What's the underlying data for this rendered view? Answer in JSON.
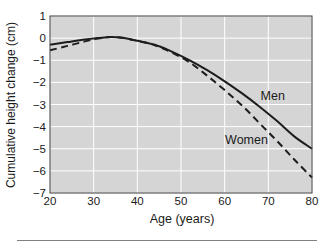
{
  "chart_data": {
    "type": "line",
    "title": "",
    "xlabel": "Age (years)",
    "ylabel": "Cumulative height change (cm)",
    "xlim": [
      20,
      80
    ],
    "ylim": [
      -7,
      1
    ],
    "xticks": [
      20,
      30,
      40,
      50,
      60,
      70,
      80
    ],
    "yticks": [
      1,
      0,
      -1,
      -2,
      -3,
      -4,
      -5,
      -6,
      -7
    ],
    "grid": true,
    "legend_position": "inline-annotations",
    "plot_bg": "#d5d5d5",
    "grid_color": "#ffffff",
    "frame_color": "#3c3c3c",
    "line_color": "#1c1c1c",
    "x": [
      20,
      24,
      28,
      31,
      34,
      37,
      40,
      44,
      48,
      52,
      56,
      60,
      64,
      68,
      72,
      76,
      80
    ],
    "series": [
      {
        "name": "Men",
        "style": "solid",
        "values": [
          -0.3,
          -0.18,
          -0.06,
          0.0,
          0.05,
          0.0,
          -0.12,
          -0.3,
          -0.62,
          -1.0,
          -1.45,
          -1.95,
          -2.5,
          -3.1,
          -3.75,
          -4.45,
          -5.0
        ],
        "label_at": [
          71,
          -2.6
        ]
      },
      {
        "name": "Women",
        "style": "dashed",
        "values": [
          -0.55,
          -0.35,
          -0.15,
          -0.02,
          0.05,
          0.0,
          -0.12,
          -0.32,
          -0.66,
          -1.1,
          -1.7,
          -2.35,
          -3.05,
          -3.85,
          -4.65,
          -5.5,
          -6.3
        ],
        "label_at": [
          65,
          -4.6
        ]
      }
    ]
  }
}
